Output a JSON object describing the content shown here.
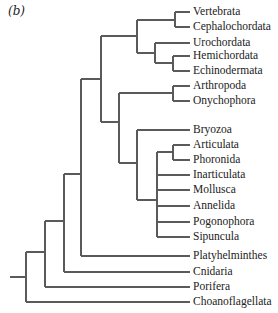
{
  "panel_label": "(b)",
  "style": {
    "line_color": "#5a5a5a",
    "text_color": "#222222",
    "background": "#ffffff"
  },
  "tree": {
    "leaf_line_end_x": 190,
    "label_x": 193,
    "root": {
      "x1": 10,
      "x2": 26,
      "y": 277
    },
    "leaves": [
      {
        "id": "vertebrata",
        "label": "Vertebrata",
        "y": 12,
        "parent_x": 175
      },
      {
        "id": "cephalochordata",
        "label": "Cephalochordata",
        "y": 27,
        "parent_x": 175
      },
      {
        "id": "urochordata",
        "label": "Urochordata",
        "y": 43,
        "parent_x": 155
      },
      {
        "id": "hemichordata",
        "label": "Hemichordata",
        "y": 56,
        "parent_x": 173
      },
      {
        "id": "echinodermata",
        "label": "Echinodermata",
        "y": 71,
        "parent_x": 173
      },
      {
        "id": "arthropoda",
        "label": "Arthropoda",
        "y": 86,
        "parent_x": 173
      },
      {
        "id": "onychophora",
        "label": "Onychophora",
        "y": 101,
        "parent_x": 173
      },
      {
        "id": "bryozoa",
        "label": "Bryozoa",
        "y": 130,
        "parent_x": 137
      },
      {
        "id": "articulata",
        "label": "Articulata",
        "y": 145,
        "parent_x": 173
      },
      {
        "id": "phoronida",
        "label": "Phoronida",
        "y": 160,
        "parent_x": 173
      },
      {
        "id": "inarticulata",
        "label": "Inarticulata",
        "y": 175,
        "parent_x": 157
      },
      {
        "id": "mollusca",
        "label": "Mollusca",
        "y": 190,
        "parent_x": 157
      },
      {
        "id": "annelida",
        "label": "Annelida",
        "y": 206,
        "parent_x": 157
      },
      {
        "id": "pogonophora",
        "label": "Pogonophora",
        "y": 222,
        "parent_x": 157
      },
      {
        "id": "sipuncula",
        "label": "Sipuncula",
        "y": 237,
        "parent_x": 157
      },
      {
        "id": "platyhelminthes",
        "label": "Platyhelminthes",
        "y": 256,
        "parent_x": 81
      },
      {
        "id": "cnidaria",
        "label": "Cnidaria",
        "y": 272,
        "parent_x": 64
      },
      {
        "id": "porifera",
        "label": "Porifera",
        "y": 287,
        "parent_x": 45
      },
      {
        "id": "choanoflagellata",
        "label": "Choanoflagellata",
        "y": 302,
        "parent_x": 26
      }
    ],
    "nodes": [
      {
        "id": "vert-ceph",
        "x": 175,
        "y_top": 12,
        "y_bottom": 27,
        "stem_y": 20,
        "parent_x": 137
      },
      {
        "id": "hemi-echino",
        "x": 173,
        "y_top": 56,
        "y_bottom": 71,
        "stem_y": 63,
        "parent_x": 155
      },
      {
        "id": "uro-ambulacraria",
        "x": 155,
        "y_top": 43,
        "y_bottom": 63,
        "stem_y": 53,
        "parent_x": 137
      },
      {
        "id": "deuterostomia",
        "x": 137,
        "y_top": 20,
        "y_bottom": 53,
        "stem_y": 36,
        "parent_x": 101
      },
      {
        "id": "arth-onych",
        "x": 173,
        "y_top": 86,
        "y_bottom": 101,
        "stem_y": 93,
        "parent_x": 119
      },
      {
        "id": "art-phor",
        "x": 173,
        "y_top": 145,
        "y_bottom": 160,
        "stem_y": 152,
        "parent_x": 157
      },
      {
        "id": "lophotrochozoa-polytomy",
        "x": 157,
        "y_top": 152,
        "y_bottom": 237,
        "stem_y": 200,
        "parent_x": 137
      },
      {
        "id": "bryozoa-group",
        "x": 137,
        "y_top": 130,
        "y_bottom": 200,
        "stem_y": 163,
        "parent_x": 119
      },
      {
        "id": "protostomia",
        "x": 119,
        "y_top": 93,
        "y_bottom": 163,
        "stem_y": 122,
        "parent_x": 101
      },
      {
        "id": "coelomata",
        "x": 101,
        "y_top": 36,
        "y_bottom": 122,
        "stem_y": 79,
        "parent_x": 81
      },
      {
        "id": "bilateria",
        "x": 81,
        "y_top": 79,
        "y_bottom": 256,
        "stem_y": 174,
        "parent_x": 64
      },
      {
        "id": "eumetazoa",
        "x": 64,
        "y_top": 174,
        "y_bottom": 272,
        "stem_y": 221,
        "parent_x": 45
      },
      {
        "id": "metazoa",
        "x": 45,
        "y_top": 221,
        "y_bottom": 287,
        "stem_y": 252,
        "parent_x": 26
      },
      {
        "id": "root-node",
        "x": 26,
        "y_top": 252,
        "y_bottom": 302,
        "stem_y": 277,
        "parent_x": 10
      }
    ]
  }
}
